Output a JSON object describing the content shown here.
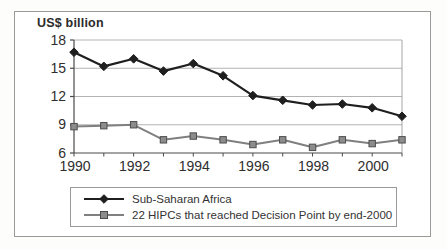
{
  "chart_data": {
    "type": "line",
    "ylabel": "US$ billion",
    "x": [
      1990,
      1991,
      1992,
      1993,
      1994,
      1995,
      1996,
      1997,
      1998,
      1999,
      2000,
      2001
    ],
    "xticks": [
      1990,
      1992,
      1994,
      1996,
      1998,
      2000
    ],
    "yticks": [
      6,
      9,
      12,
      15,
      18
    ],
    "ylim": [
      6,
      18
    ],
    "grid": "horizontal",
    "legend_position": "bottom-box",
    "series": [
      {
        "name": "Sub-Saharan Africa",
        "marker": "diamond",
        "color": "#1f1f1f",
        "marker_fill": "#1f1f1f",
        "marker_stroke": "#1f1f1f",
        "values": [
          16.7,
          15.2,
          16.0,
          14.7,
          15.5,
          14.2,
          12.1,
          11.6,
          11.1,
          11.2,
          10.8,
          9.9
        ]
      },
      {
        "name": "22 HIPCs that reached Decision Point by end-2000",
        "marker": "square",
        "color": "#808080",
        "marker_fill": "#8c8c8c",
        "marker_stroke": "#4d4d4d",
        "values": [
          8.8,
          8.9,
          9.0,
          7.4,
          7.8,
          7.4,
          6.9,
          7.4,
          6.6,
          7.4,
          7.0,
          7.4
        ]
      }
    ],
    "colors": {
      "axis": "#4a4a4a",
      "grid": "#b3b3b3",
      "right_border": "#a6a6a6",
      "tick_text": "#2e2e2e",
      "frame_border": "#9a9a9a",
      "background": "#ffffff"
    }
  }
}
